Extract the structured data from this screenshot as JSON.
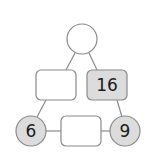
{
  "diagram": {
    "type": "arithmagon",
    "colors": {
      "line": "#8a8a8a",
      "filled": "#dcdcdc",
      "empty": "#ffffff",
      "text": "#1a1a1a"
    },
    "corners": {
      "top": {
        "value": ""
      },
      "bottom_left": {
        "value": "6"
      },
      "bottom_right": {
        "value": "9"
      }
    },
    "sides": {
      "left": {
        "value": ""
      },
      "right": {
        "value": "16"
      },
      "bottom": {
        "value": ""
      }
    }
  }
}
